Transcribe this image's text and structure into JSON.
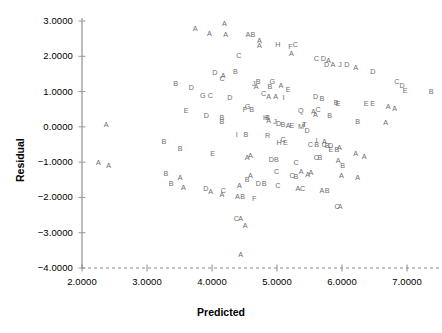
{
  "chart_data": {
    "type": "scatter",
    "title": "",
    "xlabel": "Predicted",
    "ylabel": "Residual",
    "xlim": [
      2.0,
      7.0
    ],
    "ylim": [
      -4.0,
      3.0
    ],
    "grid": false,
    "legend": "none",
    "marker_style": "letter-labels",
    "marker_color": "#6d6d6d",
    "xticks": [
      "2.0000",
      "3.0000",
      "4.0000",
      "5.0000",
      "6.0000",
      "7.0000"
    ],
    "xtick_values": [
      2.0,
      3.0,
      4.0,
      5.0,
      6.0,
      7.0
    ],
    "yticks": [
      "3.0000",
      "2.0000",
      "1.0000",
      "0.0000",
      "-1.0000",
      "-2.0000",
      "-3.0000",
      "-4.0000"
    ],
    "ytick_values": [
      3.0,
      2.0,
      1.0,
      0.0,
      -1.0,
      -2.0,
      -3.0,
      -4.0
    ],
    "x_axis_style": "dashed",
    "y_axis_style": "solid",
    "points": [
      {
        "label": "A",
        "x": 4.2,
        "y": 2.92
      },
      {
        "label": "A",
        "x": 3.75,
        "y": 2.78
      },
      {
        "label": "A",
        "x": 3.97,
        "y": 2.62
      },
      {
        "label": "A",
        "x": 4.22,
        "y": 2.6
      },
      {
        "label": "AB",
        "x": 4.56,
        "y": 2.6
      },
      {
        "label": "A",
        "x": 4.74,
        "y": 2.44
      },
      {
        "label": "A",
        "x": 4.74,
        "y": 2.28
      },
      {
        "label": "H",
        "x": 5.02,
        "y": 2.33
      },
      {
        "label": "F",
        "x": 5.22,
        "y": 2.26
      },
      {
        "label": "C",
        "x": 5.29,
        "y": 2.32
      },
      {
        "label": "C",
        "x": 4.42,
        "y": 2.0
      },
      {
        "label": "A",
        "x": 5.23,
        "y": 2.06
      },
      {
        "label": "C",
        "x": 5.61,
        "y": 1.92
      },
      {
        "label": "D",
        "x": 5.72,
        "y": 1.93
      },
      {
        "label": "A",
        "x": 5.8,
        "y": 1.86
      },
      {
        "label": "A",
        "x": 5.87,
        "y": 1.75
      },
      {
        "label": "D",
        "x": 5.77,
        "y": 1.74
      },
      {
        "label": "J",
        "x": 5.99,
        "y": 1.74
      },
      {
        "label": "D",
        "x": 6.08,
        "y": 1.74
      },
      {
        "label": "A",
        "x": 6.22,
        "y": 1.68
      },
      {
        "label": "D",
        "x": 4.05,
        "y": 1.53
      },
      {
        "label": "A",
        "x": 4.18,
        "y": 1.43
      },
      {
        "label": "C",
        "x": 4.16,
        "y": 1.36
      },
      {
        "label": "B",
        "x": 4.37,
        "y": 1.56
      },
      {
        "label": "D",
        "x": 6.48,
        "y": 1.56
      },
      {
        "label": "B",
        "x": 3.45,
        "y": 1.22
      },
      {
        "label": "D",
        "x": 3.69,
        "y": 1.1
      },
      {
        "label": "J",
        "x": 4.66,
        "y": 1.22
      },
      {
        "label": "B",
        "x": 4.72,
        "y": 1.27
      },
      {
        "label": "A",
        "x": 4.69,
        "y": 1.12
      },
      {
        "label": "G",
        "x": 4.93,
        "y": 1.28
      },
      {
        "label": "B",
        "x": 4.9,
        "y": 1.14
      },
      {
        "label": "A",
        "x": 5.07,
        "y": 1.17
      },
      {
        "label": "E",
        "x": 5.18,
        "y": 1.05
      },
      {
        "label": "C",
        "x": 6.85,
        "y": 1.28
      },
      {
        "label": "D",
        "x": 6.93,
        "y": 1.15
      },
      {
        "label": "E",
        "x": 6.98,
        "y": 1.03
      },
      {
        "label": "B",
        "x": 7.38,
        "y": 1.0
      },
      {
        "label": "G",
        "x": 3.86,
        "y": 0.88
      },
      {
        "label": "C",
        "x": 3.98,
        "y": 0.88
      },
      {
        "label": "D",
        "x": 4.28,
        "y": 0.83
      },
      {
        "label": "C",
        "x": 4.8,
        "y": 0.93
      },
      {
        "label": "A",
        "x": 4.88,
        "y": 0.85
      },
      {
        "label": "A",
        "x": 4.99,
        "y": 0.85
      },
      {
        "label": "I",
        "x": 5.13,
        "y": 0.83
      },
      {
        "label": "D",
        "x": 5.6,
        "y": 0.84
      },
      {
        "label": "B",
        "x": 5.7,
        "y": 0.8
      },
      {
        "label": "B",
        "x": 5.92,
        "y": 0.69
      },
      {
        "label": "E",
        "x": 5.95,
        "y": 0.66
      },
      {
        "label": "E",
        "x": 6.38,
        "y": 0.66
      },
      {
        "label": "E",
        "x": 6.48,
        "y": 0.66
      },
      {
        "label": "A",
        "x": 6.72,
        "y": 0.57
      },
      {
        "label": "A",
        "x": 6.82,
        "y": 0.51
      },
      {
        "label": "G",
        "x": 4.55,
        "y": 0.56
      },
      {
        "label": "F",
        "x": 4.52,
        "y": 0.47
      },
      {
        "label": "B",
        "x": 4.62,
        "y": 0.47
      },
      {
        "label": "Q",
        "x": 5.37,
        "y": 0.44
      },
      {
        "label": "A",
        "x": 5.57,
        "y": 0.42
      },
      {
        "label": "C",
        "x": 5.64,
        "y": 0.47
      },
      {
        "label": "A",
        "x": 5.6,
        "y": 0.34
      },
      {
        "label": "B",
        "x": 5.82,
        "y": 0.32
      },
      {
        "label": "E",
        "x": 3.61,
        "y": 0.46
      },
      {
        "label": "D",
        "x": 3.92,
        "y": 0.32
      },
      {
        "label": "B",
        "x": 4.16,
        "y": 0.26
      },
      {
        "label": "B",
        "x": 4.16,
        "y": 0.14
      },
      {
        "label": "A",
        "x": 2.38,
        "y": 0.06
      },
      {
        "label": "H",
        "x": 4.83,
        "y": 0.26
      },
      {
        "label": "A",
        "x": 4.88,
        "y": 0.18
      },
      {
        "label": "B",
        "x": 4.86,
        "y": 0.24
      },
      {
        "label": "J",
        "x": 4.99,
        "y": 0.14
      },
      {
        "label": "D",
        "x": 5.03,
        "y": 0.08
      },
      {
        "label": "B",
        "x": 5.1,
        "y": 0.06
      },
      {
        "label": "A",
        "x": 5.18,
        "y": 0.02
      },
      {
        "label": "E",
        "x": 5.24,
        "y": 0.02
      },
      {
        "label": "M",
        "x": 5.37,
        "y": -0.01
      },
      {
        "label": "I",
        "x": 5.45,
        "y": 0.04
      },
      {
        "label": "T",
        "x": 5.43,
        "y": 0.06
      },
      {
        "label": "D",
        "x": 5.47,
        "y": -0.12
      },
      {
        "label": "B",
        "x": 6.25,
        "y": 0.14
      },
      {
        "label": "A",
        "x": 6.68,
        "y": 0.1
      },
      {
        "label": "I",
        "x": 4.41,
        "y": -0.24
      },
      {
        "label": "B",
        "x": 4.53,
        "y": -0.24
      },
      {
        "label": "R",
        "x": 4.86,
        "y": -0.27
      },
      {
        "label": "C",
        "x": 5.1,
        "y": -0.37
      },
      {
        "label": "H",
        "x": 5.04,
        "y": -0.47
      },
      {
        "label": "E",
        "x": 5.14,
        "y": -0.47
      },
      {
        "label": "B",
        "x": 3.27,
        "y": -0.44
      },
      {
        "label": "B",
        "x": 3.52,
        "y": -0.62
      },
      {
        "label": "I",
        "x": 5.64,
        "y": -0.4
      },
      {
        "label": "A",
        "x": 5.74,
        "y": -0.43
      },
      {
        "label": "C",
        "x": 5.73,
        "y": -0.52
      },
      {
        "label": "B",
        "x": 5.78,
        "y": -0.53
      },
      {
        "label": "D",
        "x": 5.83,
        "y": -0.54
      },
      {
        "label": "E",
        "x": 5.84,
        "y": -0.65
      },
      {
        "label": "B",
        "x": 5.93,
        "y": -0.66
      },
      {
        "label": "C",
        "x": 5.52,
        "y": -0.52
      },
      {
        "label": "B",
        "x": 5.62,
        "y": -0.5
      },
      {
        "label": "A",
        "x": 5.97,
        "y": -0.6
      },
      {
        "label": "E",
        "x": 4.02,
        "y": -0.77
      },
      {
        "label": "A",
        "x": 4.6,
        "y": -0.82
      },
      {
        "label": "A",
        "x": 4.55,
        "y": -0.88
      },
      {
        "label": "D",
        "x": 4.92,
        "y": -0.95
      },
      {
        "label": "B",
        "x": 5.0,
        "y": -0.95
      },
      {
        "label": "C",
        "x": 5.3,
        "y": -1.02
      },
      {
        "label": "A",
        "x": 2.26,
        "y": -1.02
      },
      {
        "label": "A",
        "x": 2.42,
        "y": -1.1
      },
      {
        "label": "C",
        "x": 5.61,
        "y": -0.88
      },
      {
        "label": "B",
        "x": 5.67,
        "y": -0.88
      },
      {
        "label": "A",
        "x": 5.95,
        "y": -0.96
      },
      {
        "label": "A",
        "x": 6.22,
        "y": -0.78
      },
      {
        "label": "A",
        "x": 6.35,
        "y": -0.85
      },
      {
        "label": "B",
        "x": 6.02,
        "y": -1.11
      },
      {
        "label": "A",
        "x": 5.38,
        "y": -1.28
      },
      {
        "label": "A",
        "x": 5.53,
        "y": -1.32
      },
      {
        "label": "A",
        "x": 5.48,
        "y": -1.37
      },
      {
        "label": "B",
        "x": 3.3,
        "y": -1.35
      },
      {
        "label": "A",
        "x": 3.52,
        "y": -1.44
      },
      {
        "label": "C",
        "x": 5.0,
        "y": -1.28
      },
      {
        "label": "A",
        "x": 4.6,
        "y": -1.38
      },
      {
        "label": "B",
        "x": 4.55,
        "y": -1.5
      },
      {
        "label": "C",
        "x": 5.24,
        "y": -1.4
      },
      {
        "label": "B",
        "x": 5.3,
        "y": -1.42
      },
      {
        "label": "A",
        "x": 6.0,
        "y": -1.38
      },
      {
        "label": "A",
        "x": 6.25,
        "y": -1.45
      },
      {
        "label": "D",
        "x": 3.91,
        "y": -1.77
      },
      {
        "label": "A",
        "x": 3.99,
        "y": -1.84
      },
      {
        "label": "C",
        "x": 4.18,
        "y": -1.82
      },
      {
        "label": "A",
        "x": 4.16,
        "y": -1.92
      },
      {
        "label": "A",
        "x": 3.57,
        "y": -1.73
      },
      {
        "label": "B",
        "x": 3.38,
        "y": -1.62
      },
      {
        "label": "A",
        "x": 4.43,
        "y": -1.67
      },
      {
        "label": "D",
        "x": 4.72,
        "y": -1.62
      },
      {
        "label": "B",
        "x": 4.81,
        "y": -1.62
      },
      {
        "label": "C",
        "x": 5.02,
        "y": -1.68
      },
      {
        "label": "A",
        "x": 5.33,
        "y": -1.77
      },
      {
        "label": "C",
        "x": 5.4,
        "y": -1.77
      },
      {
        "label": "A",
        "x": 5.7,
        "y": -1.82
      },
      {
        "label": "B",
        "x": 5.78,
        "y": -1.82
      },
      {
        "label": "A",
        "x": 4.4,
        "y": -2.0
      },
      {
        "label": "B",
        "x": 4.48,
        "y": -2.0
      },
      {
        "label": "F",
        "x": 4.66,
        "y": -2.05
      },
      {
        "label": "C",
        "x": 5.93,
        "y": -2.28
      },
      {
        "label": "A",
        "x": 5.98,
        "y": -2.28
      },
      {
        "label": "A",
        "x": 4.52,
        "y": -2.8
      },
      {
        "label": "C",
        "x": 4.38,
        "y": -2.62
      },
      {
        "label": "A",
        "x": 4.45,
        "y": -2.62
      },
      {
        "label": "A",
        "x": 4.45,
        "y": -3.62
      }
    ]
  }
}
